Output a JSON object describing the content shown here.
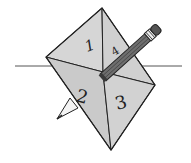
{
  "figure": {
    "sections": [
      {
        "label": "1"
      },
      {
        "label": "4"
      },
      {
        "label": "2"
      },
      {
        "label": "3"
      }
    ],
    "colors": {
      "face": "#d4d4d4",
      "edge": "#222222",
      "pencil_body": "#6e6e6e",
      "pencil_dark": "#3a3a3a",
      "background": "#ffffff"
    }
  }
}
